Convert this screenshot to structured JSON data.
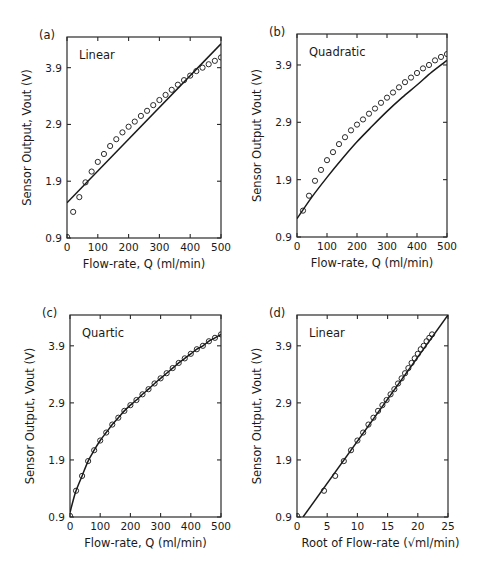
{
  "chart_data": [
    {
      "panel": "(a)",
      "type": "scatter",
      "fit_label": "Linear",
      "xlabel": "Flow-rate, Q (ml/min)",
      "ylabel": "Sensor Output, Vout (V)",
      "xlim": [
        0,
        500
      ],
      "ylim": [
        0.9,
        4.44
      ],
      "xticks": [
        0,
        100,
        200,
        300,
        400,
        500
      ],
      "xtick_labels": [
        "0",
        "100",
        "200",
        "300",
        "400",
        "500"
      ],
      "yticks": [
        0.9,
        1.9,
        2.9,
        3.9
      ],
      "ytick_labels": [
        "0.9",
        "1.9",
        "2.9",
        "3.9"
      ],
      "grid": false,
      "series": [
        {
          "name": "Measured",
          "style": "open-circle",
          "x": [
            0,
            20,
            40,
            60,
            80,
            100,
            120,
            140,
            160,
            180,
            200,
            220,
            240,
            260,
            280,
            300,
            320,
            340,
            360,
            380,
            400,
            420,
            440,
            460,
            480,
            500
          ],
          "y": [
            0.92,
            1.36,
            1.62,
            1.88,
            2.07,
            2.24,
            2.38,
            2.52,
            2.64,
            2.76,
            2.86,
            2.95,
            3.05,
            3.14,
            3.24,
            3.33,
            3.42,
            3.51,
            3.6,
            3.68,
            3.76,
            3.84,
            3.9,
            3.96,
            4.02,
            4.08
          ]
        },
        {
          "name": "Linear fit",
          "style": "line",
          "x": [
            0,
            500
          ],
          "y": [
            1.52,
            4.32
          ]
        }
      ]
    },
    {
      "panel": "(b)",
      "type": "scatter",
      "fit_label": "Quadratic",
      "xlabel": "Flow-rate, Q (ml/min)",
      "ylabel": "Sensor Output Vout (V)",
      "xlim": [
        0,
        500
      ],
      "ylim": [
        0.9,
        4.44
      ],
      "xticks": [
        0,
        100,
        200,
        300,
        400,
        500
      ],
      "xtick_labels": [
        "0",
        "100",
        "200",
        "300",
        "400",
        "500"
      ],
      "yticks": [
        0.9,
        1.9,
        2.9,
        3.9
      ],
      "ytick_labels": [
        "0.9",
        "1.9",
        "2.9",
        "3.9"
      ],
      "grid": false,
      "series": [
        {
          "name": "Measured",
          "style": "open-circle",
          "x": [
            20,
            40,
            60,
            80,
            100,
            120,
            140,
            160,
            180,
            200,
            220,
            240,
            260,
            280,
            300,
            320,
            340,
            360,
            380,
            400,
            420,
            440,
            460,
            480,
            500
          ],
          "y": [
            1.36,
            1.62,
            1.88,
            2.07,
            2.24,
            2.38,
            2.52,
            2.64,
            2.76,
            2.86,
            2.95,
            3.05,
            3.14,
            3.24,
            3.33,
            3.42,
            3.51,
            3.6,
            3.68,
            3.76,
            3.84,
            3.9,
            3.98,
            4.04,
            4.09
          ]
        },
        {
          "name": "Quadratic fit",
          "style": "curve",
          "x": [
            0,
            50,
            100,
            150,
            200,
            250,
            300,
            350,
            400,
            450,
            500
          ],
          "y": [
            1.22,
            1.6,
            1.94,
            2.26,
            2.56,
            2.83,
            3.09,
            3.33,
            3.55,
            3.78,
            3.98
          ]
        }
      ]
    },
    {
      "panel": "(c)",
      "type": "scatter",
      "fit_label": "Quartic",
      "xlabel": "Flow-rate, Q (ml/min)",
      "ylabel": "Sensor Output, Vout (V)",
      "xlim": [
        0,
        500
      ],
      "ylim": [
        0.9,
        4.44
      ],
      "xticks": [
        0,
        100,
        200,
        300,
        400,
        500
      ],
      "xtick_labels": [
        "0",
        "100",
        "200",
        "300",
        "400",
        "500"
      ],
      "yticks": [
        0.9,
        1.9,
        2.9,
        3.9
      ],
      "ytick_labels": [
        "0.9",
        "1.9",
        "2.9",
        "3.9"
      ],
      "grid": false,
      "series": [
        {
          "name": "Measured",
          "style": "open-circle",
          "x": [
            0,
            20,
            40,
            60,
            80,
            100,
            120,
            140,
            160,
            180,
            200,
            220,
            240,
            260,
            280,
            300,
            320,
            340,
            360,
            380,
            400,
            420,
            440,
            460,
            480,
            500
          ],
          "y": [
            0.92,
            1.36,
            1.62,
            1.88,
            2.07,
            2.24,
            2.38,
            2.52,
            2.64,
            2.76,
            2.86,
            2.95,
            3.05,
            3.14,
            3.24,
            3.33,
            3.42,
            3.51,
            3.6,
            3.68,
            3.76,
            3.84,
            3.9,
            3.98,
            4.04,
            4.1
          ]
        },
        {
          "name": "Quartic fit",
          "style": "curve",
          "x": [
            0,
            10,
            20,
            40,
            60,
            80,
            100,
            120,
            140,
            160,
            180,
            200,
            220,
            240,
            260,
            280,
            300,
            320,
            340,
            360,
            380,
            400,
            420,
            440,
            460,
            480,
            500
          ],
          "y": [
            0.98,
            1.18,
            1.36,
            1.62,
            1.88,
            2.07,
            2.24,
            2.38,
            2.52,
            2.64,
            2.76,
            2.86,
            2.95,
            3.05,
            3.14,
            3.24,
            3.33,
            3.42,
            3.51,
            3.6,
            3.68,
            3.76,
            3.84,
            3.9,
            3.98,
            4.04,
            4.1
          ]
        }
      ]
    },
    {
      "panel": "(d)",
      "type": "scatter",
      "fit_label": "Linear",
      "xlabel": "Root of Flow-rate (√ml/min)",
      "ylabel": "Sensor Output, Vout (V)",
      "xlim": [
        0,
        25
      ],
      "ylim": [
        0.9,
        4.44
      ],
      "xticks": [
        0,
        5,
        10,
        15,
        20,
        25
      ],
      "xtick_labels": [
        "0",
        "5",
        "10",
        "15",
        "20",
        "25"
      ],
      "yticks": [
        0.9,
        1.9,
        2.9,
        3.9
      ],
      "ytick_labels": [
        "0.9",
        "1.9",
        "2.9",
        "3.9"
      ],
      "grid": false,
      "series": [
        {
          "name": "Measured",
          "style": "open-circle",
          "x": [
            0,
            4.47,
            6.32,
            7.75,
            8.94,
            10.0,
            10.95,
            11.83,
            12.65,
            13.42,
            14.14,
            14.83,
            15.49,
            16.12,
            16.73,
            17.32,
            17.89,
            18.44,
            18.97,
            19.49,
            20.0,
            20.49,
            20.98,
            21.45,
            21.91,
            22.36
          ],
          "y": [
            0.92,
            1.36,
            1.62,
            1.88,
            2.07,
            2.24,
            2.38,
            2.52,
            2.64,
            2.76,
            2.86,
            2.95,
            3.05,
            3.14,
            3.24,
            3.33,
            3.42,
            3.51,
            3.6,
            3.68,
            3.76,
            3.84,
            3.9,
            3.98,
            4.04,
            4.1
          ]
        },
        {
          "name": "Linear fit",
          "style": "line",
          "x": [
            1.0,
            25
          ],
          "y": [
            0.9,
            4.44
          ]
        }
      ]
    }
  ],
  "panels_layout": [
    {
      "box": [
        67,
        37,
        221,
        238
      ]
    },
    {
      "box": [
        297,
        34,
        447,
        237
      ]
    },
    {
      "box": [
        70,
        315,
        221,
        517
      ]
    },
    {
      "box": [
        297,
        315,
        448,
        517
      ]
    }
  ]
}
